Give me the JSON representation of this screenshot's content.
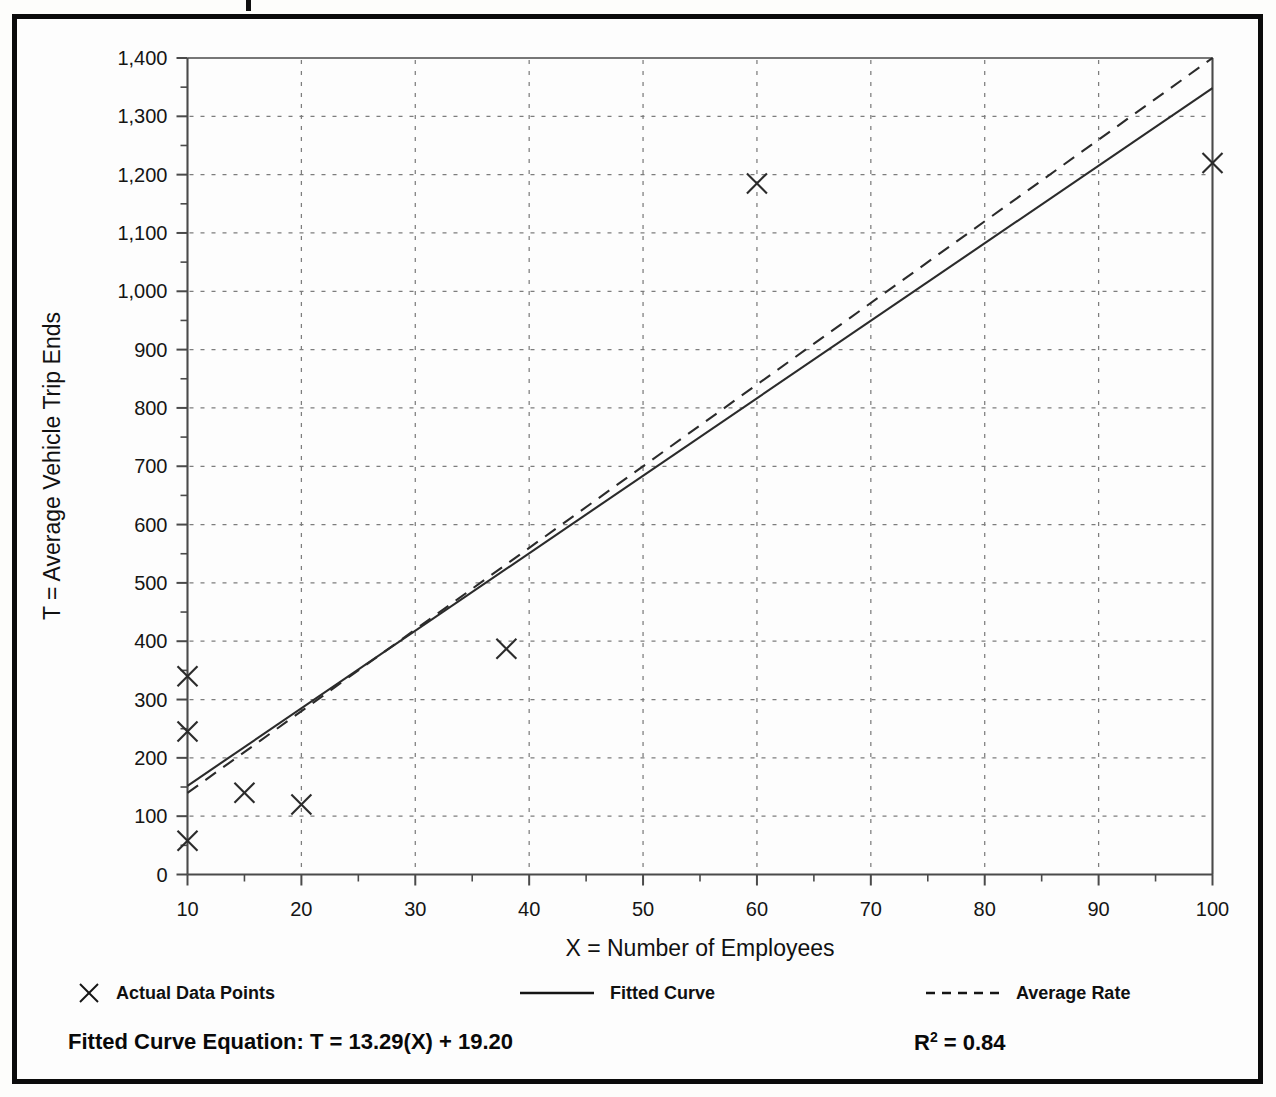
{
  "chart_data": {
    "type": "scatter",
    "title": "",
    "xlabel": "X = Number of Employees",
    "ylabel": "T = Average Vehicle Trip Ends",
    "xlim": [
      10,
      100
    ],
    "ylim": [
      0,
      1400
    ],
    "grid": true,
    "x_ticks": [
      10,
      20,
      30,
      40,
      50,
      60,
      70,
      80,
      90,
      100
    ],
    "x_tick_labels": [
      "10",
      "20",
      "30",
      "40",
      "50",
      "60",
      "70",
      "80",
      "90",
      "100"
    ],
    "x_minor_step": 5,
    "y_ticks": [
      0,
      100,
      200,
      300,
      400,
      500,
      600,
      700,
      800,
      900,
      1000,
      1100,
      1200,
      1300,
      1400
    ],
    "y_tick_labels": [
      "0",
      "100",
      "200",
      "300",
      "400",
      "500",
      "600",
      "700",
      "800",
      "900",
      "1,000",
      "1,100",
      "1,200",
      "1,300",
      "1,400"
    ],
    "y_minor_step": 50,
    "legend_position": "below-axis",
    "series": [
      {
        "name": "Actual Data Points",
        "type": "scatter",
        "marker": "x",
        "points": [
          {
            "x": 10,
            "y": 340
          },
          {
            "x": 10,
            "y": 245
          },
          {
            "x": 10,
            "y": 58
          },
          {
            "x": 15,
            "y": 140
          },
          {
            "x": 20,
            "y": 120
          },
          {
            "x": 38,
            "y": 387
          },
          {
            "x": 60,
            "y": 1185
          },
          {
            "x": 100,
            "y": 1220
          }
        ]
      },
      {
        "name": "Fitted Curve",
        "type": "line",
        "style": "solid",
        "equation": "T = 13.29(X) + 19.20",
        "slope": 13.29,
        "intercept": 19.2,
        "endpoints": [
          {
            "x": 10,
            "y": 152.1
          },
          {
            "x": 100,
            "y": 1348.2
          }
        ]
      },
      {
        "name": "Average Rate",
        "type": "line",
        "style": "dashed",
        "slope": 14.0,
        "intercept": 0,
        "endpoints": [
          {
            "x": 10,
            "y": 140
          },
          {
            "x": 100,
            "y": 1400
          }
        ]
      }
    ]
  },
  "legend": {
    "items": [
      {
        "label": "Actual Data Points",
        "marker": "x-marker"
      },
      {
        "label": "Fitted Curve",
        "marker": "solid-line"
      },
      {
        "label": "Average Rate",
        "marker": "dashed-line"
      }
    ]
  },
  "footer": {
    "equation_label": "Fitted Curve Equation:  T = 13.29(X) + 19.20",
    "r_squared_base": "R",
    "r_squared_exp": "2",
    "r_squared_value": " = 0.84"
  },
  "axes": {
    "x_title": "X = Number of Employees",
    "y_title": "T = Average Vehicle Trip Ends"
  }
}
